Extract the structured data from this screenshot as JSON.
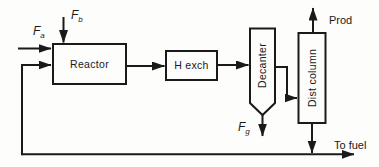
{
  "diagram": {
    "colors": {
      "line": "#1a1a1a",
      "background": "#fdfdfc"
    },
    "blocks": {
      "reactor": {
        "label": "Reactor"
      },
      "heat_exchanger": {
        "label": "H exch"
      },
      "decanter": {
        "label": "Decanter"
      },
      "dist_column": {
        "label": "Dist column"
      }
    },
    "streams": {
      "feed_a": {
        "symbol": "F",
        "subscript": "a"
      },
      "feed_b": {
        "symbol": "F",
        "subscript": "b"
      },
      "purge_g": {
        "symbol": "F",
        "subscript": "g"
      },
      "product": {
        "label": "Prod"
      },
      "to_fuel": {
        "label": "To fuel"
      }
    }
  }
}
